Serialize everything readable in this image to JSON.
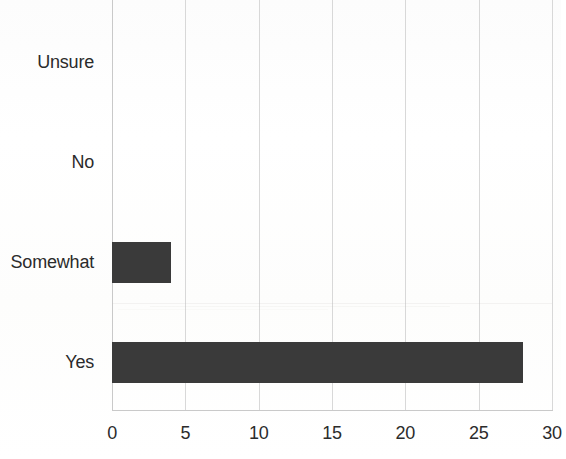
{
  "chart_data": {
    "type": "bar",
    "orientation": "horizontal",
    "title": "",
    "subtitle": "",
    "xlabel": "",
    "ylabel": "",
    "categories": [
      "Yes",
      "Somewhat",
      "No",
      "Unsure"
    ],
    "values": [
      28,
      4,
      0,
      0
    ],
    "series": [
      {
        "name": "Responses",
        "values": [
          28,
          4,
          0,
          0
        ]
      }
    ],
    "xlim": [
      0,
      30
    ],
    "xticks": [
      0,
      5,
      10,
      15,
      20,
      25,
      30
    ],
    "xtick_labels": [
      "0",
      "5",
      "10",
      "15",
      "20",
      "25",
      "30"
    ],
    "grid": {
      "vertical": true,
      "horizontal": false,
      "color": "#d8d8d8"
    },
    "legend": {
      "visible": false,
      "position": "none",
      "entries": []
    },
    "bar_color": "#3a3a3a",
    "background_color": "#ffffff",
    "axis_color": "#c9c9c9",
    "text_color": "#2b2b2b",
    "annotations": []
  },
  "axis": {
    "category_labels": [
      {
        "text": "Unsure",
        "value": 0,
        "center_y": 62
      },
      {
        "text": "No",
        "value": 0,
        "center_y": 162
      },
      {
        "text": "Somewhat",
        "value": 4,
        "center_y": 262
      },
      {
        "text": "Yes",
        "value": 28,
        "center_y": 362
      }
    ],
    "ticks": [
      {
        "label": "0",
        "value": 0
      },
      {
        "label": "5",
        "value": 5
      },
      {
        "label": "10",
        "value": 10
      },
      {
        "label": "15",
        "value": 15
      },
      {
        "label": "20",
        "value": 20
      },
      {
        "label": "25",
        "value": 25
      },
      {
        "label": "30",
        "value": 30
      }
    ]
  }
}
